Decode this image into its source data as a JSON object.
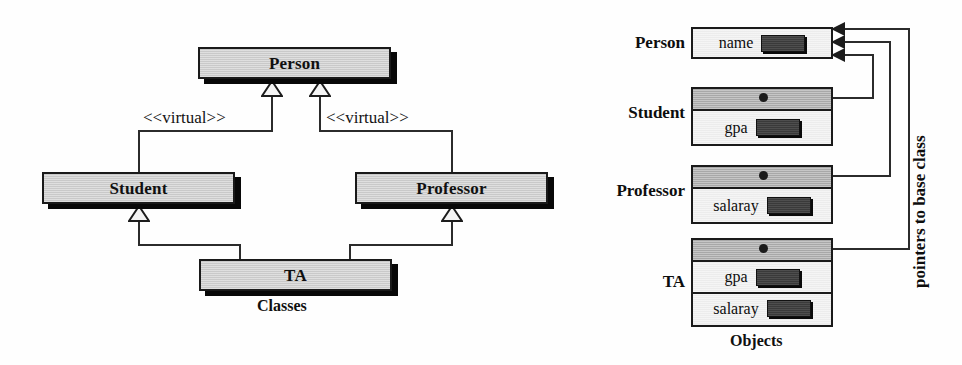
{
  "diagram": {
    "left_caption": "Classes",
    "right_caption": "Objects",
    "side_note": "pointers to base class",
    "colors": {
      "class_box_fill": "#c9c9c9",
      "object_data_fill": "#ececec",
      "object_pointer_fill": "#a8a8a8",
      "field_slot_fill": "#3a3a3a",
      "line": "#2b2b2b",
      "border": "#1a1a1a",
      "shadow": "#080808",
      "background": "#ffffff"
    }
  },
  "classes": {
    "person": {
      "label": "Person"
    },
    "student": {
      "label": "Student"
    },
    "professor": {
      "label": "Professor"
    },
    "ta": {
      "label": "TA"
    },
    "stereotype_left": "<<virtual>>",
    "stereotype_right": "<<virtual>>"
  },
  "objects": [
    {
      "name": "Person",
      "rows": [
        {
          "kind": "data",
          "field": "name",
          "has_slot": true
        }
      ]
    },
    {
      "name": "Student",
      "rows": [
        {
          "kind": "pointer",
          "field": "",
          "has_slot": false
        },
        {
          "kind": "data",
          "field": "gpa",
          "has_slot": true
        }
      ]
    },
    {
      "name": "Professor",
      "rows": [
        {
          "kind": "pointer",
          "field": "",
          "has_slot": false
        },
        {
          "kind": "data",
          "field": "salaray",
          "has_slot": true
        }
      ]
    },
    {
      "name": "TA",
      "rows": [
        {
          "kind": "pointer",
          "field": "",
          "has_slot": false
        },
        {
          "kind": "data",
          "field": "gpa",
          "has_slot": true
        },
        {
          "kind": "data",
          "field": "salaray",
          "has_slot": true
        }
      ]
    }
  ]
}
